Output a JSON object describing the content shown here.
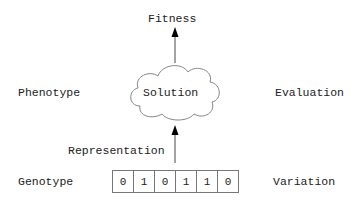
{
  "labels": {
    "fitness": "Fitness",
    "phenotype": "Phenotype",
    "solution": "Solution",
    "evaluation": "Evaluation",
    "representation": "Representation",
    "genotype": "Genotype",
    "variation": "Variation"
  },
  "genotype_bits": [
    "0",
    "1",
    "0",
    "1",
    "1",
    "0"
  ],
  "colors": {
    "line": "#777777",
    "arrow": "#000000",
    "text": "#222222"
  }
}
